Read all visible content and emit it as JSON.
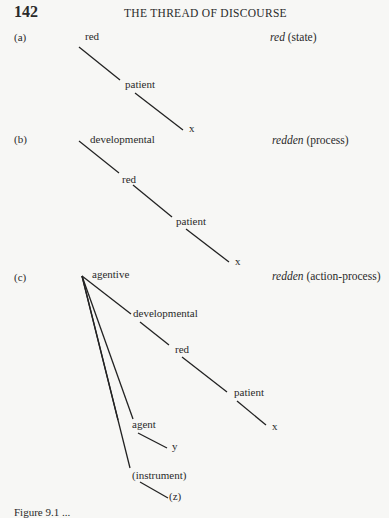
{
  "page": {
    "number": "142",
    "running_head": "THE THREAD OF DISCOURSE"
  },
  "figures": {
    "a": {
      "label": "(a)",
      "nodes": [
        "red",
        "patient",
        "x"
      ],
      "gloss_word": "red",
      "gloss_type": "(state)"
    },
    "b": {
      "label": "(b)",
      "nodes": [
        "developmental",
        "red",
        "patient",
        "x"
      ],
      "gloss_word": "redden",
      "gloss_type": "(process)"
    },
    "c": {
      "label": "(c)",
      "nodes": [
        "agentive",
        "developmental",
        "red",
        "patient",
        "x",
        "agent",
        "y",
        "(instrument)",
        "(z)"
      ],
      "gloss_word": "redden",
      "gloss_type": "(action-process)"
    }
  },
  "caption": "Figure 9.1 ..."
}
